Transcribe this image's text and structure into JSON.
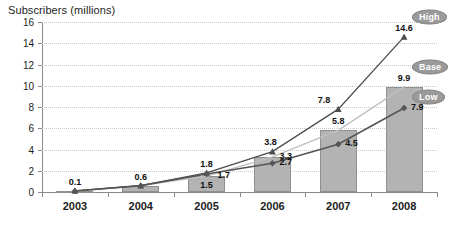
{
  "chart_data": {
    "type": "line",
    "title": "Subscribers (millions)",
    "ylabel": "Subscribers (millions)",
    "xlabel": "",
    "categories": [
      "2003",
      "2004",
      "2005",
      "2006",
      "2007",
      "2008"
    ],
    "ylim": [
      0,
      16
    ],
    "ytick_step": 2,
    "yticks": [
      "0",
      "2",
      "4",
      "6",
      "8",
      "10",
      "12",
      "14",
      "16"
    ],
    "grid": true,
    "legend_position": "right",
    "series": [
      {
        "name": "High",
        "marker": "triangle",
        "type": "line",
        "values": [
          0.1,
          0.6,
          1.8,
          3.8,
          7.8,
          14.6
        ],
        "labels": [
          "0.1",
          "0.6",
          "1.8",
          "3.8",
          "7.8",
          "14.6"
        ]
      },
      {
        "name": "Base",
        "marker": "none",
        "type": "bar",
        "values": [
          0.1,
          0.6,
          1.5,
          3.3,
          5.8,
          9.9
        ],
        "labels": [
          "0.1",
          "0.6",
          "1.5",
          "3.3",
          "5.8",
          "9.9"
        ]
      },
      {
        "name": "Low",
        "marker": "diamond",
        "type": "line",
        "values": [
          0.1,
          0.6,
          1.7,
          2.7,
          4.5,
          7.9
        ],
        "labels": [
          "0.1",
          "0.6",
          "1.7",
          "2.7",
          "4.5",
          "7.9"
        ]
      }
    ],
    "colors": {
      "bar_fill": "#b3b3b3",
      "bar_stroke": "#8f8f8f",
      "high_line": "#4d4d4d",
      "base_line": "#c0c0c0",
      "low_line": "#555555",
      "gridline": "#c9c9c9",
      "axis": "#8a8a8a",
      "badge_fill": "#9a9a9a",
      "badge_text": "#ffffff",
      "text": "#1d1d1d",
      "background": "#ffffff"
    }
  },
  "legend": {
    "items": [
      {
        "label": "High",
        "value": "14.6"
      },
      {
        "label": "Base",
        "value": "9.9"
      },
      {
        "label": "Low",
        "value": "7.9"
      }
    ]
  }
}
